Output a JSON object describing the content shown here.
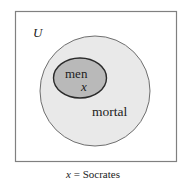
{
  "diagram": {
    "universe": {
      "label": "U",
      "border_color": "#808080",
      "fill_color": "#ffffff"
    },
    "sets": [
      {
        "name": "mortal",
        "label": "mortal",
        "fill_color": "#e9e9e9",
        "border_color": "#6f6f6f"
      },
      {
        "name": "men",
        "label": "men",
        "fill_color": "#b9b9b9",
        "border_color": "#2a2a2a"
      }
    ],
    "element": {
      "symbol": "x",
      "located_in": "men"
    },
    "caption": {
      "variable": "x",
      "equals": "=",
      "value": "Socrates",
      "full": "x = Socrates"
    }
  }
}
